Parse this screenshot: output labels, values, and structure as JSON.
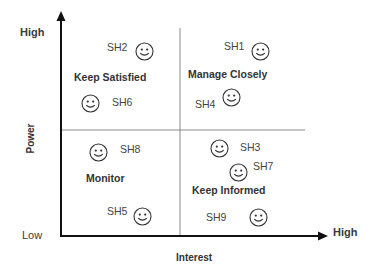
{
  "diagram": {
    "type": "power-interest-grid",
    "y_axis": {
      "title": "Power",
      "low": "Low",
      "high": "High"
    },
    "x_axis": {
      "title": "Interest",
      "high": "High"
    },
    "quadrants": [
      {
        "id": "top-left",
        "label": "Keep Satisfied"
      },
      {
        "id": "top-right",
        "label": "Manage Closely"
      },
      {
        "id": "bottom-left",
        "label": "Monitor"
      },
      {
        "id": "bottom-right",
        "label": "Keep Informed"
      }
    ],
    "stakeholders": [
      {
        "label": "SH1",
        "quadrant": "top-right"
      },
      {
        "label": "SH2",
        "quadrant": "top-left"
      },
      {
        "label": "SH3",
        "quadrant": "bottom-right"
      },
      {
        "label": "SH4",
        "quadrant": "top-right"
      },
      {
        "label": "SH5",
        "quadrant": "bottom-left"
      },
      {
        "label": "SH6",
        "quadrant": "top-left"
      },
      {
        "label": "SH7",
        "quadrant": "bottom-right"
      },
      {
        "label": "SH8",
        "quadrant": "bottom-left"
      },
      {
        "label": "SH9",
        "quadrant": "bottom-right"
      }
    ],
    "stakeholder_icon": "smiley-face-icon",
    "colors": {
      "axis": "#111111",
      "divider": "#8a8a8a",
      "text": "#333333"
    }
  }
}
